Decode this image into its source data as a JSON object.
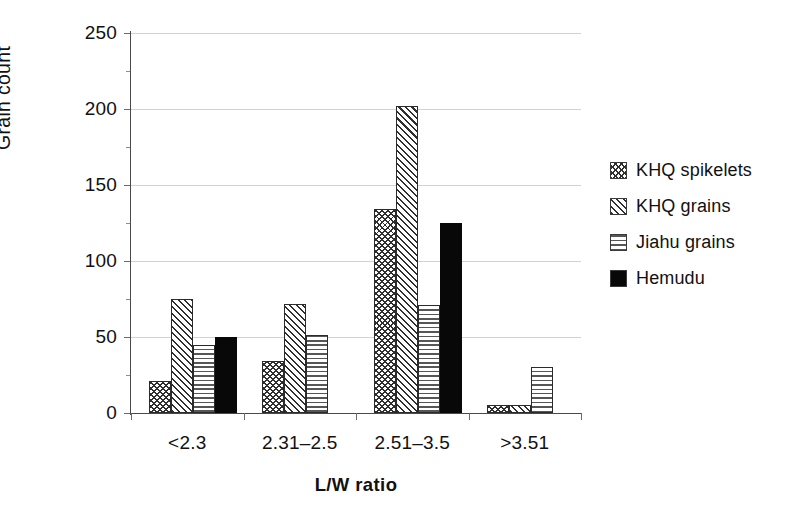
{
  "chart_data": {
    "type": "bar",
    "title": "",
    "subtitle": "",
    "xlabel": "L/W ratio",
    "ylabel": "Grain count",
    "categories": [
      "<2.3",
      "2.31–2.5",
      "2.51–3.5",
      ">3.51"
    ],
    "series": [
      {
        "name": "KHQ spikelets",
        "pattern": "chevron-hatch",
        "values": [
          21,
          34,
          134,
          5
        ]
      },
      {
        "name": "KHQ grains",
        "pattern": "diagonal-hatch",
        "values": [
          75,
          72,
          202,
          5
        ]
      },
      {
        "name": "Jiahu grains",
        "pattern": "horizontal-hatch",
        "values": [
          45,
          51,
          71,
          30
        ]
      },
      {
        "name": "Hemudu",
        "pattern": "solid-black",
        "values": [
          50,
          0,
          125,
          0
        ]
      }
    ],
    "ylim": [
      0,
      250
    ],
    "yticks": [
      0,
      50,
      100,
      150,
      200,
      250
    ],
    "ytick_labels": [
      "0",
      "50",
      "100",
      "150",
      "200",
      "250"
    ],
    "grid": true,
    "grid_axis": "y",
    "legend_position": "right",
    "colors": {
      "hatch": "#2f2f2f",
      "solid": "#080808",
      "gridline": "#d2d2d2",
      "axis": "#4a4a4a",
      "text": "#111111",
      "background": "#ffffff"
    }
  },
  "axes": {
    "y": {
      "label": "Grain count"
    },
    "x": {
      "title": "L/W ratio"
    }
  },
  "legend": {
    "items": [
      {
        "label": "KHQ spikelets"
      },
      {
        "label": "KHQ grains"
      },
      {
        "label": "Jiahu grains"
      },
      {
        "label": "Hemudu"
      }
    ]
  }
}
